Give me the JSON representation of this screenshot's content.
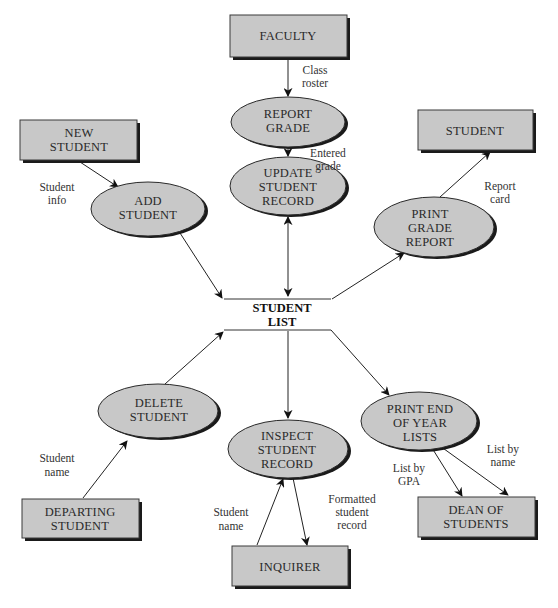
{
  "diagram": {
    "type": "data-flow-diagram",
    "colors": {
      "shape_fill": "#c8c8c8",
      "shape_stroke": "#2a2a2a",
      "shadow": "#1a1a1a",
      "text": "#2a2a2a",
      "background": "#ffffff"
    },
    "external_entities": {
      "faculty": {
        "line1": "FACULTY"
      },
      "new_student": {
        "line1": "NEW",
        "line2": "STUDENT"
      },
      "student": {
        "line1": "STUDENT"
      },
      "departing_student": {
        "line1": "DEPARTING",
        "line2": "STUDENT"
      },
      "inquirer": {
        "line1": "INQUIRER"
      },
      "dean_of_students": {
        "line1": "DEAN OF",
        "line2": "STUDENTS"
      }
    },
    "processes": {
      "report_grade": {
        "line1": "REPORT",
        "line2": "GRADE"
      },
      "update_student_record": {
        "line1": "UPDATE",
        "line2": "STUDENT",
        "line3": "RECORD"
      },
      "add_student": {
        "line1": "ADD",
        "line2": "STUDENT"
      },
      "print_grade_report": {
        "line1": "PRINT",
        "line2": "GRADE",
        "line3": "REPORT"
      },
      "delete_student": {
        "line1": "DELETE",
        "line2": "STUDENT"
      },
      "inspect_student_record": {
        "line1": "INSPECT",
        "line2": "STUDENT",
        "line3": "RECORD"
      },
      "print_end_of_year_lists": {
        "line1": "PRINT END",
        "line2": "OF YEAR",
        "line3": "LISTS"
      }
    },
    "data_store": {
      "student_list": {
        "line1": "STUDENT",
        "line2": "LIST"
      }
    },
    "flows": {
      "class_roster": {
        "line1": "Class",
        "line2": "roster",
        "from": "FACULTY",
        "to": "REPORT GRADE"
      },
      "entered_grade": {
        "line1": "Entered",
        "line2": "grade",
        "from": "REPORT GRADE",
        "to": "UPDATE STUDENT RECORD"
      },
      "student_info": {
        "line1": "Student",
        "line2": "info",
        "from": "NEW STUDENT",
        "to": "ADD STUDENT"
      },
      "report_card": {
        "line1": "Report",
        "line2": "card",
        "from": "PRINT GRADE REPORT",
        "to": "STUDENT"
      },
      "student_name_delete": {
        "line1": "Student",
        "line2": "name",
        "from": "DEPARTING STUDENT",
        "to": "DELETE STUDENT"
      },
      "student_name_inspect": {
        "line1": "Student",
        "line2": "name",
        "from": "INQUIRER",
        "to": "INSPECT STUDENT RECORD"
      },
      "formatted_student_record": {
        "line1": "Formatted",
        "line2": "student",
        "line3": "record",
        "from": "INSPECT STUDENT RECORD",
        "to": "INQUIRER"
      },
      "list_by_gpa": {
        "line1": "List by",
        "line2": "GPA",
        "from": "PRINT END OF YEAR LISTS",
        "to": "DEAN OF STUDENTS"
      },
      "list_by_name": {
        "line1": "List by",
        "line2": "name",
        "from": "PRINT END OF YEAR LISTS",
        "to": "DEAN OF STUDENTS"
      }
    }
  }
}
